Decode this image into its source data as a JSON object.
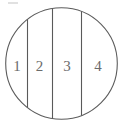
{
  "figure": {
    "background_color": "#ffffff",
    "stroke_color": "#5a5a5a",
    "label_color": "#6b6b6b",
    "circle": {
      "center_x": 61.5,
      "center_y": 63.5,
      "radius": 55.8
    },
    "dividers": [
      {
        "name": "divider-1",
        "x": 27.5
      },
      {
        "name": "divider-2",
        "x": 52.5
      },
      {
        "name": "divider-3",
        "x": 81.5
      }
    ],
    "regions": [
      {
        "id": "region-1",
        "label": "1",
        "center_x": 17,
        "baseline_y": 71
      },
      {
        "id": "region-2",
        "label": "2",
        "center_x": 39.5,
        "baseline_y": 71
      },
      {
        "id": "region-3",
        "label": "3",
        "center_x": 67,
        "baseline_y": 71
      },
      {
        "id": "region-4",
        "label": "4",
        "center_x": 98,
        "baseline_y": 71
      }
    ],
    "artifact": {
      "name": "top-left-smudge",
      "x": 8,
      "y": 2,
      "width": 10,
      "height": 2
    }
  }
}
